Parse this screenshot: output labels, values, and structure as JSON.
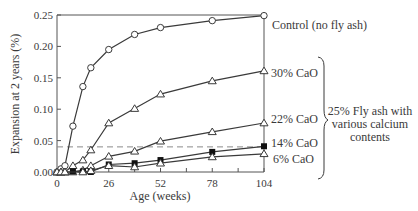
{
  "chart_data": {
    "type": "line",
    "title": "",
    "xlabel": "Age (weeks)",
    "ylabel": "Expansion at 2 years (%)",
    "xlim": [
      0,
      104
    ],
    "ylim": [
      0,
      0.25
    ],
    "xticks": [
      0,
      26,
      52,
      78,
      104
    ],
    "xtick_labels": [
      "0",
      "26",
      "52",
      "78",
      "104"
    ],
    "yticks": [
      0,
      0.05,
      0.1,
      0.15,
      0.2,
      0.25
    ],
    "ytick_labels": [
      "0.00",
      "0.05",
      "0.10",
      "0.15",
      "0.20",
      "0.25"
    ],
    "grid": false,
    "legend_position": "right (direct labels)",
    "reference_line": {
      "y": 0.04,
      "style": "dashed",
      "color": "#8a8a8a"
    },
    "series": [
      {
        "name": "Control (no fly ash)",
        "marker": "circle-open",
        "x": [
          0,
          2,
          4,
          8,
          13,
          17,
          26,
          39,
          52,
          78,
          104
        ],
        "y": [
          0.0,
          0.005,
          0.01,
          0.073,
          0.136,
          0.166,
          0.195,
          0.219,
          0.23,
          0.241,
          0.249
        ]
      },
      {
        "name": "30% CaO",
        "marker": "triangle-open",
        "x": [
          0,
          2,
          4,
          8,
          13,
          17,
          26,
          39,
          52,
          78,
          104
        ],
        "y": [
          0.0,
          0.0,
          0.0,
          0.01,
          0.019,
          0.035,
          0.078,
          0.101,
          0.124,
          0.145,
          0.161
        ]
      },
      {
        "name": "22% CaO",
        "marker": "triangle-open",
        "x": [
          0,
          2,
          4,
          8,
          13,
          17,
          26,
          39,
          52,
          78,
          104
        ],
        "y": [
          0.0,
          0.0,
          0.0,
          0.0,
          0.003,
          0.01,
          0.025,
          0.033,
          0.049,
          0.064,
          0.078
        ]
      },
      {
        "name": "14% CaO",
        "marker": "square-filled",
        "x": [
          8,
          13,
          17,
          26,
          39,
          52,
          78,
          104
        ],
        "y": [
          0.001,
          0.001,
          0.0,
          0.012,
          0.014,
          0.019,
          0.032,
          0.041
        ]
      },
      {
        "name": "6% CaO",
        "marker": "triangle-open",
        "x": [
          0,
          2,
          4,
          13,
          17,
          26,
          39,
          52,
          78,
          104
        ],
        "y": [
          0.0,
          0.0,
          0.0,
          0.0,
          0.002,
          0.01,
          0.008,
          0.014,
          0.024,
          0.029
        ]
      }
    ],
    "annotations": [
      {
        "text": "25% Fly ash with various calcium contents",
        "type": "brace",
        "groups": [
          "30% CaO",
          "22% CaO",
          "14% CaO",
          "6% CaO"
        ]
      }
    ]
  },
  "labels": {
    "control": "Control (no fly ash)",
    "cao30": "30% CaO",
    "cao22": "22% CaO",
    "cao14": "14% CaO",
    "cao6": "6% CaO",
    "brace_line1": "25% Fly ash with",
    "brace_line2": "various calcium",
    "brace_line3": "contents"
  },
  "colors": {
    "line": "#3a3a3a",
    "axis": "#555555",
    "dashed": "#8a8a8a",
    "text": "#3a3a3a"
  }
}
